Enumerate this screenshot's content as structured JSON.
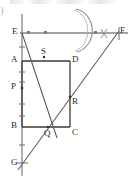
{
  "figure": {
    "kind": "geometry-construction-diagram",
    "background_color": "#ffffff",
    "stroke_color": "#3a3a3a",
    "light_stroke_color": "#7a7a7a",
    "width": 136,
    "height": 178,
    "artifact_text": ")",
    "points": [
      {
        "id": "E",
        "label": "E",
        "x": 22,
        "y": 33,
        "label_x": 12,
        "label_y": 27
      },
      {
        "id": "F",
        "label": "F",
        "x": 122,
        "y": 33,
        "label_x": 120,
        "label_y": 26
      },
      {
        "id": "A",
        "label": "A",
        "x": 22,
        "y": 61,
        "label_x": 11,
        "label_y": 55
      },
      {
        "id": "D",
        "label": "D",
        "x": 70,
        "y": 61,
        "label_x": 72,
        "label_y": 55
      },
      {
        "id": "S",
        "label": "S",
        "x": 44,
        "y": 57,
        "label_x": 41,
        "label_y": 47
      },
      {
        "id": "P",
        "label": "P",
        "x": 22,
        "y": 88,
        "label_x": 11,
        "label_y": 82
      },
      {
        "id": "R",
        "label": "R",
        "x": 70,
        "y": 97,
        "label_x": 72,
        "label_y": 97
      },
      {
        "id": "B",
        "label": "B",
        "x": 22,
        "y": 127,
        "label_x": 11,
        "label_y": 121
      },
      {
        "id": "C",
        "label": "C",
        "x": 70,
        "y": 127,
        "label_x": 72,
        "label_y": 128
      },
      {
        "id": "Q",
        "label": "Q",
        "x": 48,
        "y": 127,
        "label_x": 44,
        "label_y": 129
      },
      {
        "id": "G",
        "label": "G",
        "x": 22,
        "y": 163,
        "label_x": 11,
        "label_y": 158
      }
    ],
    "segments": [
      {
        "name": "line-EF-horizontal",
        "x1": 20,
        "y1": 33,
        "x2": 128,
        "y2": 33
      },
      {
        "name": "line-EG-vertical",
        "x1": 22,
        "y1": 14,
        "x2": 22,
        "y2": 176
      },
      {
        "name": "rect-side-AD",
        "x1": 22,
        "y1": 61,
        "x2": 70,
        "y2": 61
      },
      {
        "name": "rect-side-DC",
        "x1": 70,
        "y1": 61,
        "x2": 70,
        "y2": 127
      },
      {
        "name": "rect-side-CB",
        "x1": 70,
        "y1": 127,
        "x2": 22,
        "y2": 127
      },
      {
        "name": "rect-side-BA",
        "x1": 22,
        "y1": 127,
        "x2": 22,
        "y2": 61
      },
      {
        "name": "diagonal-E-to-Q",
        "x1": 22,
        "y1": 33,
        "x2": 57,
        "y2": 138
      },
      {
        "name": "diagonal-G-to-F",
        "x1": 18,
        "y1": 170,
        "x2": 119,
        "y2": 31
      }
    ],
    "tick_marks": {
      "vertical_axis": [
        {
          "name": "tick-above-A",
          "x": 22,
          "y": 47
        },
        {
          "name": "tick-below-A",
          "x": 22,
          "y": 72
        },
        {
          "name": "tick-above-P",
          "x": 22,
          "y": 82
        },
        {
          "name": "tick-below-P",
          "x": 22,
          "y": 104
        },
        {
          "name": "tick-above-B",
          "x": 22,
          "y": 116
        },
        {
          "name": "tick-below-B",
          "x": 22,
          "y": 145
        }
      ],
      "horizontal_axis": [
        {
          "name": "tick-EF-1",
          "x": 45,
          "y": 33
        },
        {
          "name": "tick-EF-2",
          "x": 95,
          "y": 33
        }
      ],
      "endpoint_caps": [
        {
          "name": "cap-at-E",
          "x": 22,
          "y": 33
        },
        {
          "name": "cap-at-G",
          "x": 22,
          "y": 163
        },
        {
          "name": "cap-at-F",
          "x": 119,
          "y": 33
        }
      ]
    },
    "construction_marks": {
      "arc": {
        "name": "construction-arc",
        "cx": 58,
        "cy": 30,
        "rx": 20,
        "ry": 22,
        "start_x": 76,
        "start_y": 9,
        "end_x": 77,
        "end_y": 52
      },
      "cross": {
        "name": "construction-cross-mark",
        "x": 104,
        "y": 33,
        "size": 5
      }
    }
  }
}
